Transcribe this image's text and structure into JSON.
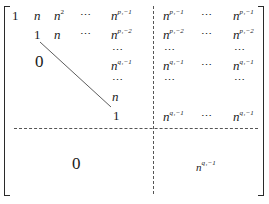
{
  "matrix": {
    "description": "Block upper-triangular matrix with dashed partition lines",
    "row1": {
      "c1": "1",
      "c2": "n",
      "c3_base": "n",
      "c3_sup": "2",
      "c4": "⋯",
      "c5_base": "n",
      "c5_sup": "p₁−1",
      "c6_base": "n",
      "c6_sup": "p₁−1",
      "c7": "⋯",
      "c8_base": "n",
      "c8_sup": "p₁−1"
    },
    "row2": {
      "c2": "1",
      "c3": "n",
      "c4": "⋯",
      "c5_base": "n",
      "c5_sup": "p₁−2",
      "c6_base": "n",
      "c6_sup": "p₁−2",
      "c7": "⋯",
      "c8_base": "n",
      "c8_sup": "p₁−2"
    },
    "row3": {
      "c5": "⋯",
      "c6": "⋯",
      "c8": "⋯"
    },
    "row4": {
      "c5_base": "n",
      "c5_sup": "q₁−1",
      "c6_base": "n",
      "c6_sup": "q₁−1",
      "c7": "⋯",
      "c8_base": "n",
      "c8_sup": "q₁−1"
    },
    "row5": {
      "c5": "⋯",
      "c6": "⋯",
      "c8": "⋯"
    },
    "row6": {
      "c5": "n"
    },
    "row7": {
      "c5": "1",
      "c6_base": "n",
      "c6_sup": "q₁−1",
      "c7": "⋯",
      "c8_base": "n",
      "c8_sup": "q₁−1"
    },
    "lower_triangle_zero": "0",
    "bottom_left_block": "0",
    "bottom_right_block_base": "n",
    "bottom_right_block_sup": "q₁−1"
  }
}
